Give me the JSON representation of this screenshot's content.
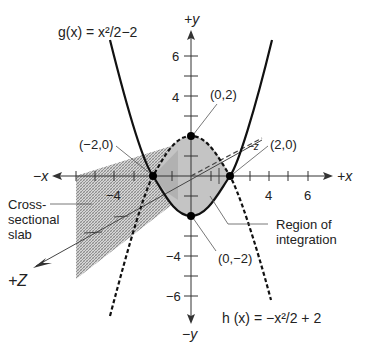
{
  "diagram": {
    "functions": {
      "g": {
        "label": "g(x) = x²/2−2",
        "expr": "x^2/2 - 2",
        "style": "solid"
      },
      "h": {
        "label": "h (x) = −x²/2 + 2",
        "expr": "-x^2/2 + 2",
        "style": "dashed"
      }
    },
    "axes": {
      "pos_x": "+x",
      "neg_x": "−x",
      "pos_y": "+y",
      "neg_y": "−y",
      "pos_z": "+Z",
      "neg_z": "−z",
      "x_ticks": [
        {
          "value": -4,
          "label": "−4"
        },
        {
          "value": 4,
          "label": "4"
        },
        {
          "value": 6,
          "label": "6"
        }
      ],
      "y_ticks": [
        {
          "value": 6,
          "label": "6"
        },
        {
          "value": 4,
          "label": "4"
        },
        {
          "value": -4,
          "label": "−4"
        },
        {
          "value": -6,
          "label": "−6"
        }
      ]
    },
    "points": [
      {
        "label": "(−2,0)",
        "x": -2,
        "y": 0
      },
      {
        "label": "(0,2)",
        "x": 0,
        "y": 2
      },
      {
        "label": "(2,0)",
        "x": 2,
        "y": 0
      },
      {
        "label": "(0,−2)",
        "x": 0,
        "y": -2
      }
    ],
    "annotations": {
      "slab_line1": "Cross-",
      "slab_line2": "sectional",
      "slab_line3": "slab",
      "region_line1": "Region of",
      "region_line2": "integration"
    },
    "colors": {
      "region_fill": "#c4c4c4",
      "slab_fill": "#b9b9b9",
      "curve": "#111111",
      "axis": "#333333"
    }
  }
}
